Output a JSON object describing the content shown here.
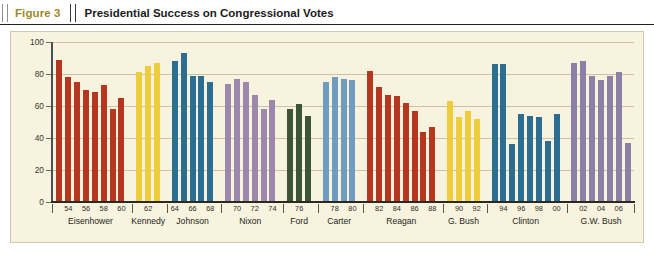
{
  "header": {
    "figure_label": "Figure 3",
    "title": "Presidential Success on Congressional Votes"
  },
  "chart_data": {
    "type": "bar",
    "title": "Presidential Success on Congressional Votes",
    "xlabel": "",
    "ylabel": "",
    "ylim": [
      0,
      100
    ],
    "yticks": [
      0,
      20,
      40,
      60,
      80,
      100
    ],
    "grid": true,
    "legend": "none",
    "x_tick_labels": [
      "54",
      "56",
      "58",
      "60",
      "62",
      "64",
      "66",
      "68",
      "70",
      "72",
      "74",
      "76",
      "78",
      "80",
      "82",
      "84",
      "86",
      "88",
      "90",
      "92",
      "94",
      "96",
      "98",
      "00",
      "02",
      "04",
      "06"
    ],
    "groups": [
      {
        "name": "Eisenhower",
        "color": "#b5371f",
        "years": [
          "53",
          "54",
          "55",
          "56",
          "57",
          "58",
          "59",
          "60"
        ],
        "values": [
          89,
          78,
          75,
          70,
          69,
          73,
          58,
          65
        ]
      },
      {
        "name": "Kennedy",
        "color": "#edcd3c",
        "years": [
          "61",
          "62",
          "63"
        ],
        "values": [
          81,
          85,
          87
        ]
      },
      {
        "name": "Johnson",
        "color": "#2b6e92",
        "years": [
          "64",
          "65",
          "66",
          "67",
          "68"
        ],
        "values": [
          88,
          93,
          79,
          79,
          75
        ]
      },
      {
        "name": "Nixon",
        "color": "#9d87ad",
        "years": [
          "69",
          "70",
          "71",
          "72",
          "73",
          "74"
        ],
        "values": [
          74,
          77,
          75,
          67,
          58,
          64
        ]
      },
      {
        "name": "Ford",
        "color": "#3d5534",
        "years": [
          "75",
          "76",
          "77"
        ],
        "values": [
          58,
          61,
          54
        ]
      },
      {
        "name": "Carter",
        "color": "#6f9cc0",
        "years": [
          "77",
          "78",
          "79",
          "80"
        ],
        "values": [
          75,
          78,
          77,
          76
        ]
      },
      {
        "name": "Reagan",
        "color": "#b5371f",
        "years": [
          "81",
          "82",
          "83",
          "84",
          "85",
          "86",
          "87",
          "88"
        ],
        "values": [
          82,
          72,
          67,
          66,
          62,
          57,
          44,
          47
        ]
      },
      {
        "name": "G. Bush",
        "color": "#edcd3c",
        "years": [
          "89",
          "90",
          "91",
          "92"
        ],
        "values": [
          63,
          53,
          57,
          52
        ]
      },
      {
        "name": "Clinton",
        "color": "#2b6e92",
        "years": [
          "93",
          "94",
          "95",
          "96",
          "97",
          "98",
          "99",
          "00"
        ],
        "values": [
          86,
          86,
          36,
          55,
          54,
          53,
          38,
          55
        ]
      },
      {
        "name": "G.W. Bush",
        "color": "#8d7fa5",
        "years": [
          "01",
          "02",
          "03",
          "04",
          "05",
          "06",
          "07"
        ],
        "values": [
          87,
          88,
          79,
          76,
          79,
          81,
          37
        ]
      }
    ]
  },
  "colors": {
    "panel_background": "#f7f3de",
    "figure_label": "#9c8a2a",
    "axis": "#2a2a22",
    "gridline": "#c9c3a6"
  }
}
